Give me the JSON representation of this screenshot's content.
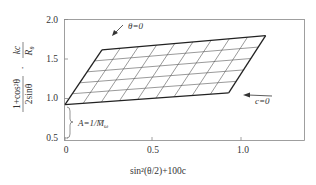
{
  "chart_data": {
    "type": "line",
    "title": "",
    "xlabel": "sin²(θ/2)+100c",
    "ylabel": "(1+cos²θ)/(2sinθ) · kc/R_θ",
    "ylabel_parts": {
      "frac1_num": "1+cos²θ",
      "frac1_den": "2sinθ",
      "dot": "·",
      "frac2_num": "kc",
      "frac2_den": "R",
      "frac2_den_sub": "θ"
    },
    "xlim": [
      0,
      1.37
    ],
    "ylim": [
      0.5,
      2.0
    ],
    "x_ticks": [
      {
        "value": 0,
        "label": "0"
      },
      {
        "value": 0.5,
        "label": "0.5"
      },
      {
        "value": 1.0,
        "label": "1.0"
      }
    ],
    "y_ticks": [
      {
        "value": 0.5,
        "label": "0.5"
      },
      {
        "value": 1.0,
        "label": "1.0"
      },
      {
        "value": 1.5,
        "label": "1.5"
      },
      {
        "value": 2.0,
        "label": "2.0"
      }
    ],
    "grid": false,
    "zimm_grid": {
      "description": "Zimm plot parallelogram grid",
      "corners": {
        "origin": {
          "x": 0.0,
          "y": 0.92
        },
        "theta0_end": {
          "x": 0.93,
          "y": 1.07
        },
        "c0_end": {
          "x": 0.21,
          "y": 1.61
        },
        "far_corner": {
          "x": 1.14,
          "y": 1.79
        }
      },
      "columns": 9,
      "rows": 5
    },
    "series": [
      {
        "name": "θ=0 line",
        "x": [
          0.0,
          0.93
        ],
        "y": [
          0.92,
          1.07
        ]
      },
      {
        "name": "c=0 line",
        "x": [
          0.0,
          0.21
        ],
        "y": [
          0.92,
          1.61
        ]
      },
      {
        "name": "upper boundary",
        "x": [
          0.21,
          1.14
        ],
        "y": [
          1.61,
          1.79
        ]
      },
      {
        "name": "right boundary",
        "x": [
          0.93,
          1.14
        ],
        "y": [
          1.07,
          1.79
        ]
      }
    ],
    "annotations": [
      {
        "text": "θ=0",
        "arrow": true,
        "x": 0.32,
        "y": 1.9
      },
      {
        "text": "c=0",
        "arrow": true,
        "x": 1.08,
        "y": 1.0
      },
      {
        "text": "A=1/M̄",
        "subscript": "ω",
        "brace": true,
        "x": 0.05,
        "y": 0.7
      }
    ]
  }
}
